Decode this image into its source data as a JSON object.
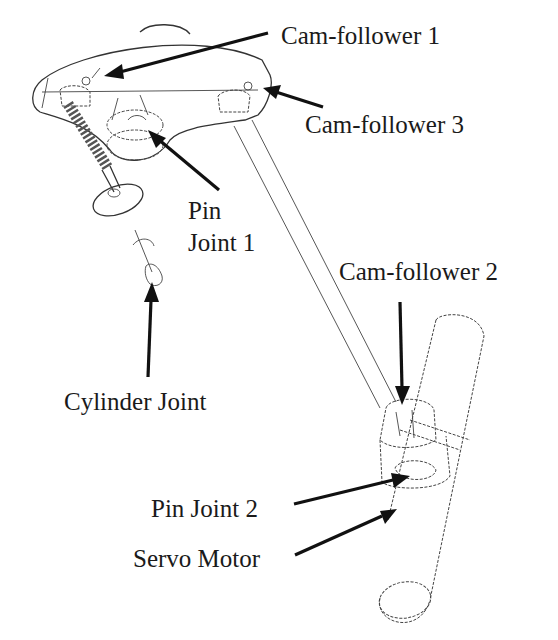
{
  "diagram": {
    "labels": {
      "cam_follower_1": "Cam-follower 1",
      "cam_follower_3": "Cam-follower 3",
      "pin_joint_1_line1": "Pin",
      "pin_joint_1_line2": "Joint 1",
      "cylinder_joint": "Cylinder Joint",
      "cam_follower_2": "Cam-follower 2",
      "pin_joint_2": "Pin Joint 2",
      "servo_motor": "Servo Motor"
    },
    "components": [
      "rocker-arm",
      "valve-spring",
      "valve",
      "push-rod",
      "camshaft",
      "cylinder-joint"
    ],
    "colors": {
      "line": "#333333",
      "arrow": "#111111",
      "background": "#ffffff",
      "text": "#1a1a1a"
    }
  }
}
